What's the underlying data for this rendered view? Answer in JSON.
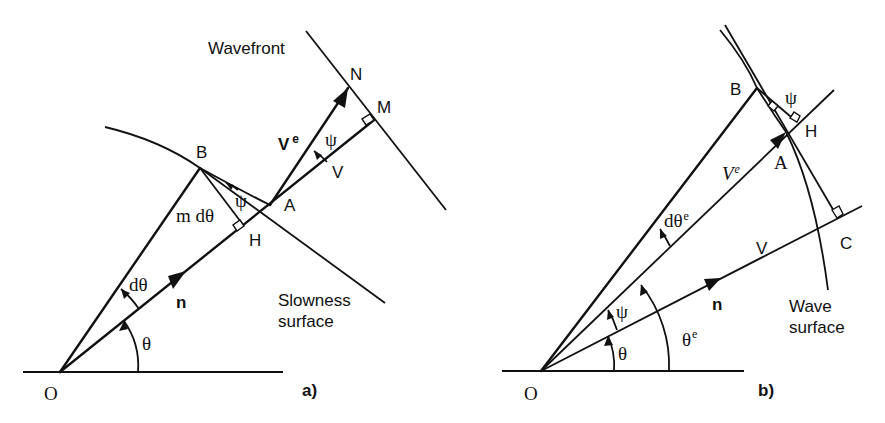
{
  "panel_a": {
    "caption": "a)",
    "points": {
      "O": "O",
      "A": "A",
      "B": "B",
      "H": "H",
      "N": "N",
      "M": "M"
    },
    "labels": {
      "wavefront": "Wavefront",
      "slowness_line1": "Slowness",
      "slowness_line2": "surface",
      "n_vector": "n",
      "ve_vector": "V",
      "ve_sup": "e",
      "v_label": "V",
      "theta": "θ",
      "dtheta": "dθ",
      "m_dtheta": "m dθ",
      "psi_top": "ψ",
      "psi_mid": "ψ"
    }
  },
  "panel_b": {
    "caption": "b)",
    "points": {
      "O": "O",
      "A": "A",
      "B": "B",
      "H": "H",
      "C": "C"
    },
    "labels": {
      "wave_line1": "Wave",
      "wave_line2": "surface",
      "n_vector": "n",
      "ve_vector": "V",
      "ve_sup": "e",
      "v_label": "V",
      "theta": "θ",
      "theta_e": "θ",
      "theta_e_sup": "e",
      "dtheta_e": "dθ",
      "dtheta_e_sup": "e",
      "psi_top": "ψ",
      "psi_low": "ψ"
    }
  },
  "colors": {
    "ink": "#111111",
    "background": "#ffffff"
  }
}
